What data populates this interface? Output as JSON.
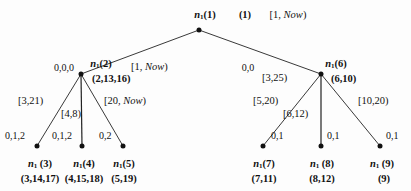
{
  "figure": {
    "type": "tree-diagram",
    "background_color": "#fdfdfd",
    "ink_color": "#111111"
  },
  "root": {
    "name": "n",
    "sub": "1",
    "index": "(1)",
    "tuple": "(1)",
    "interval": "[1, Now)"
  },
  "nodes": [
    {
      "id": "n2",
      "name": "n",
      "sub": "1",
      "index": "(2)",
      "tuple": "(2,13,16)",
      "left_digits": "0,0,0",
      "edge_interval": "[1, Now)"
    },
    {
      "id": "n6",
      "name": "n",
      "sub": "1",
      "index": "(6)",
      "tuple": "(6,10)",
      "left_digits": "0,0",
      "edge_interval": "[3,25)"
    }
  ],
  "leaves": [
    {
      "id": "n3",
      "name": "n",
      "sub": "1",
      "index": "(3)",
      "tuple": "(3,14,17)",
      "edge_interval": "[3,21)",
      "edge_digits": "0,1,2"
    },
    {
      "id": "n4",
      "name": "n",
      "sub": "1",
      "index": "(4)",
      "tuple": "(4,15,18)",
      "edge_interval": "[4,8)",
      "edge_digits": "0,1,2"
    },
    {
      "id": "n5",
      "name": "n",
      "sub": "1",
      "index": "(5)",
      "tuple": "(5,19)",
      "edge_interval": "[20, Now)",
      "edge_digits": "0,2"
    },
    {
      "id": "n7",
      "name": "n",
      "sub": "1",
      "index": "(7)",
      "tuple": "(7,11)",
      "edge_interval": "[5,20)",
      "edge_digits": "0,1"
    },
    {
      "id": "n8",
      "name": "n",
      "sub": "1",
      "index": "(8)",
      "tuple": "(8,12)",
      "edge_interval": "[6,12)",
      "edge_digits": "0,1"
    },
    {
      "id": "n9",
      "name": "n",
      "sub": "1",
      "index": "(9)",
      "tuple": "(9)",
      "edge_interval": "[10,20)",
      "edge_digits": "0,1"
    }
  ],
  "italic_word": "Now"
}
